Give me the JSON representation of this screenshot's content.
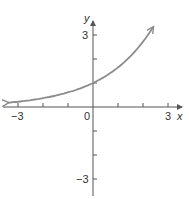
{
  "chart_data": {
    "type": "line",
    "title": "",
    "xlabel": "x",
    "ylabel": "y",
    "xlim": [
      -3.6,
      3.7
    ],
    "ylim": [
      -3.8,
      3.6
    ],
    "x_ticks": [
      -3,
      -2,
      -1,
      0,
      1,
      2,
      3
    ],
    "y_ticks": [
      -3,
      -2,
      -1,
      1,
      2,
      3
    ],
    "x_tick_labels": [
      "-3",
      "0",
      "3"
    ],
    "y_tick_labels": [
      "3",
      "-3"
    ],
    "grid": false,
    "legend": null,
    "series": [
      {
        "name": "curve",
        "description": "increasing exponential, y-intercept 1, horizontal asymptote y=0 on left",
        "x": [
          -3.4,
          -3,
          -2,
          -1,
          0,
          1,
          2,
          2.4
        ],
        "y": [
          0.18,
          0.22,
          0.37,
          0.61,
          1.0,
          1.65,
          2.72,
          3.32
        ],
        "arrows": "both",
        "color": "#8c8c8c"
      }
    ]
  },
  "labels": {
    "x_axis": "x",
    "y_axis": "y",
    "x_neg3": "−3",
    "x_zero": "0",
    "x_pos3": "3",
    "y_pos3": "3",
    "y_neg3": "−3"
  },
  "colors": {
    "axis": "#555555",
    "curve": "#8c8c8c"
  }
}
